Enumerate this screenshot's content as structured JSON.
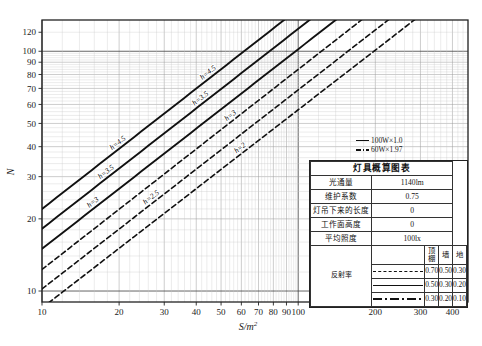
{
  "chart_data": {
    "type": "line",
    "title": "灯具概算图表",
    "xlabel": "S/m²",
    "ylabel": "N",
    "xscale": "log",
    "yscale": "log",
    "xlim": [
      10,
      460
    ],
    "ylim": [
      9,
      135
    ],
    "grid": true,
    "xticks": [
      10,
      20,
      30,
      40,
      50,
      60,
      70,
      80,
      90,
      100,
      200,
      300,
      400
    ],
    "xticklabels": [
      "10",
      "20",
      "30",
      "40",
      "50",
      "60",
      "70",
      "80",
      "90",
      "100",
      "200",
      "300",
      "400"
    ],
    "yticks": [
      10,
      20,
      30,
      40,
      50,
      60,
      70,
      80,
      90,
      100,
      120
    ],
    "yticklabels": [
      "10",
      "20",
      "30",
      "40",
      "50",
      "60",
      "70",
      "80",
      "90",
      "100",
      "120"
    ],
    "legend_position": "inside-right",
    "series": [
      {
        "name": "h=4.5",
        "style": "solid",
        "label": "h=4.5",
        "N_at_S10": 22.0,
        "N_at_S100": 150.0,
        "slope": 0.835
      },
      {
        "name": "h=3.5",
        "style": "solid",
        "label": "h=3.5",
        "N_at_S10": 18.2,
        "N_at_S100": 124.0,
        "slope": 0.835
      },
      {
        "name": "h=3",
        "style": "solid",
        "label": "h=3",
        "N_at_S10": 15.0,
        "N_at_S100": 102.0,
        "slope": 0.835
      },
      {
        "name": "h=3d",
        "style": "dashed",
        "label": "h=3",
        "N_at_S10": 12.3,
        "N_at_S100": 84.0,
        "slope": 0.835
      },
      {
        "name": "h=2.5",
        "style": "dashed",
        "label": "h=2.5",
        "N_at_S10": 10.2,
        "N_at_S100": 69.0,
        "slope": 0.835
      },
      {
        "name": "h=2",
        "style": "dashed",
        "label": "h=2",
        "N_at_S10": 8.5,
        "N_at_S100": 57.0,
        "slope": 0.835
      }
    ],
    "annotations": [
      {
        "text": "100W×1.0",
        "style": "solid"
      },
      {
        "text": "60W×1.97",
        "style": "dash-dot"
      }
    ]
  },
  "legend_table": {
    "title": "灯具概算图表",
    "rows": [
      {
        "key": "光通量",
        "value": "1140lm"
      },
      {
        "key": "维护系数",
        "value": "0.75"
      },
      {
        "key": "灯吊下来的长度",
        "value": "0"
      },
      {
        "key": "工作面高度",
        "value": "0"
      },
      {
        "key": "平均照度",
        "value": "100lx"
      }
    ],
    "reflectance": {
      "row_label": "反射率",
      "columns": [
        "顶棚",
        "墙",
        "地"
      ],
      "rows": [
        {
          "style": "dashed",
          "values": [
            "0.70",
            "0.50",
            "0.30"
          ]
        },
        {
          "style": "solid",
          "values": [
            "0.50",
            "0.30",
            "0.20"
          ]
        },
        {
          "style": "dash-dot",
          "values": [
            "0.30",
            "0.20",
            "0.10"
          ]
        }
      ]
    }
  },
  "axes": {
    "y_title": "N",
    "x_title": "S/m",
    "x_title_sup": "2"
  },
  "colors": {
    "curve": "#111111",
    "grid_minor": "#9a9a9a",
    "grid_major": "#4a4a4a",
    "frame": "#222222",
    "background": "#ffffff"
  }
}
